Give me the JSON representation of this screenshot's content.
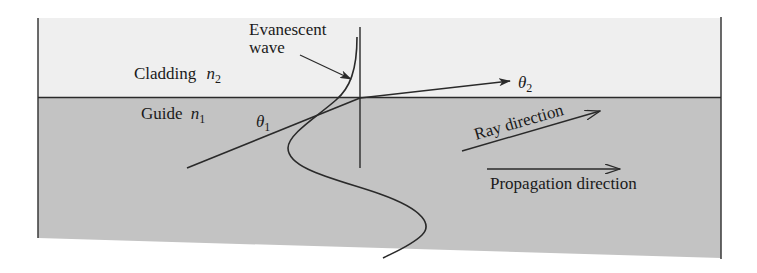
{
  "diagram": {
    "type": "optical-waveguide-total-internal-reflection",
    "regions": {
      "cladding": {
        "label": "Cladding",
        "index_symbol": "n",
        "index_sub": "2",
        "color": "#efefef"
      },
      "guide": {
        "label": "Guide",
        "index_symbol": "n",
        "index_sub": "1",
        "color": "#c3c3c3"
      }
    },
    "labels": {
      "evanescent_line1": "Evanescent",
      "evanescent_line2": "wave",
      "theta1_symbol": "θ",
      "theta1_sub": "1",
      "theta2_symbol": "θ",
      "theta2_sub": "2",
      "ray_direction": "Ray direction",
      "propagation_direction": "Propagation direction"
    },
    "colors": {
      "line": "#2a2a2a",
      "border": "#3a3a3a"
    }
  }
}
